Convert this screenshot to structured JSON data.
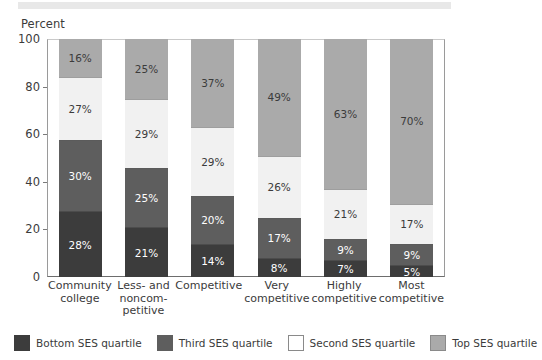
{
  "top_band": {
    "color": "#e8e8e8"
  },
  "chart_data": {
    "type": "bar",
    "subtype": "stacked-percent",
    "title": "",
    "axis_title": "Percent",
    "xlabel": "",
    "ylabel": "Percent",
    "ylim": [
      0,
      100
    ],
    "yticks": [
      0,
      20,
      40,
      60,
      80,
      100
    ],
    "grid": false,
    "legend_position": "bottom",
    "categories": [
      "Community college",
      "Less- and noncom-petitive",
      "Competitive",
      "Very competitive",
      "Highly competitive",
      "Most competitive"
    ],
    "category_lines": [
      [
        "Community",
        "college"
      ],
      [
        "Less- and",
        "noncom-",
        "petitive"
      ],
      [
        "Competitive"
      ],
      [
        "Very",
        "competitive"
      ],
      [
        "Highly",
        "competitive"
      ],
      [
        "Most",
        "competitive"
      ]
    ],
    "series": [
      {
        "name": "Bottom SES quartile",
        "color": "#3c3c3c",
        "label_color": "#ffffff",
        "values": [
          28,
          21,
          14,
          8,
          7,
          5
        ],
        "labels": [
          "28%",
          "21%",
          "14%",
          "8%",
          "7%",
          "5%"
        ]
      },
      {
        "name": "Third SES quartile",
        "color": "#5e5e5e",
        "label_color": "#ffffff",
        "values": [
          30,
          25,
          20,
          17,
          9,
          9
        ],
        "labels": [
          "30%",
          "25%",
          "20%",
          "17%",
          "9%",
          "9%"
        ]
      },
      {
        "name": "Second SES quartile",
        "color": "#f1f1f1",
        "label_color": "#3b3b3b",
        "values": [
          27,
          29,
          29,
          26,
          21,
          17
        ],
        "labels": [
          "27%",
          "29%",
          "29%",
          "26%",
          "21%",
          "17%"
        ]
      },
      {
        "name": "Top SES quartile",
        "color": "#aaaaaa",
        "label_color": "#3b3b3b",
        "values": [
          16,
          25,
          37,
          49,
          63,
          70
        ],
        "labels": [
          "16%",
          "25%",
          "37%",
          "49%",
          "63%",
          "70%"
        ]
      }
    ]
  },
  "legend": {
    "items": [
      {
        "label": "Bottom SES quartile",
        "color": "#3c3c3c",
        "border": "#3c3c3c"
      },
      {
        "label": "Third SES quartile",
        "color": "#5e5e5e",
        "border": "#5e5e5e"
      },
      {
        "label": "Second SES quartile",
        "color": "#ffffff",
        "border": "#8a8a8a"
      },
      {
        "label": "Top SES quartile",
        "color": "#aaaaaa",
        "border": "#8a8a8a"
      }
    ]
  }
}
